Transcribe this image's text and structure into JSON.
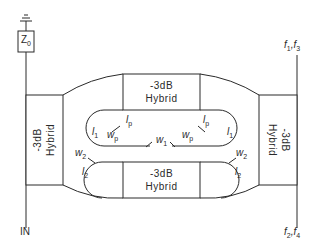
{
  "diagram": {
    "type": "microwave multiplexer schematic",
    "hybrids": {
      "left": {
        "line1": "-3dB",
        "line2": "Hybrid"
      },
      "top": {
        "line1": "-3dB",
        "line2": "Hybrid"
      },
      "bottom": {
        "line1": "-3dB",
        "line2": "Hybrid"
      },
      "right": {
        "line1": "-3dB",
        "line2": "Hybrid"
      }
    },
    "termination": {
      "label": "Z",
      "sub": "0",
      "symbol": "ground-icon"
    },
    "ports": {
      "input": "IN",
      "out_top": {
        "a": "f",
        "a_sub": "1",
        "sep": ",",
        "b": "f",
        "b_sub": "3"
      },
      "out_bottom": {
        "a": "f",
        "a_sub": "2",
        "sep": ",",
        "b": "f",
        "b_sub": "4"
      }
    },
    "annotations": {
      "l1_left": {
        "t": "l",
        "s": "1"
      },
      "l1_right": {
        "t": "l",
        "s": "1"
      },
      "l2_left": {
        "t": "l",
        "s": "2"
      },
      "l2_right": {
        "t": "l",
        "s": "2"
      },
      "w2_left": {
        "t": "w",
        "s": "2"
      },
      "w2_right": {
        "t": "w",
        "s": "2"
      },
      "lp_left": {
        "t": "l",
        "s": "p"
      },
      "lp_right": {
        "t": "l",
        "s": "p"
      },
      "wp_left": {
        "t": "w",
        "s": "p"
      },
      "wp_right": {
        "t": "w",
        "s": "p"
      },
      "w1": {
        "t": "w",
        "s": "1"
      }
    }
  }
}
